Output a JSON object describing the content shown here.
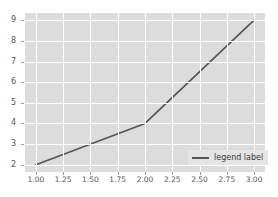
{
  "chart_data": {
    "type": "line",
    "title": "",
    "xlabel": "",
    "ylabel": "",
    "x": [
      1.0,
      2.0,
      3.0
    ],
    "series": [
      {
        "name": "legend label",
        "values": [
          2,
          4,
          9
        ],
        "color": "#555555"
      }
    ],
    "xlim": [
      0.9,
      3.1
    ],
    "ylim": [
      1.65,
      9.35
    ],
    "xticks": [
      1.0,
      1.25,
      1.5,
      1.75,
      2.0,
      2.25,
      2.5,
      2.75,
      3.0
    ],
    "xticklabels": [
      "1.00",
      "1.25",
      "1.50",
      "1.75",
      "2.00",
      "2.25",
      "2.50",
      "2.75",
      "3.00"
    ],
    "yticks": [
      2,
      3,
      4,
      5,
      6,
      7,
      8,
      9
    ],
    "yticklabels": [
      "2",
      "3",
      "4",
      "5",
      "6",
      "7",
      "8",
      "9"
    ],
    "grid": true,
    "grid_color": "#ffffff",
    "axes_facecolor": "#dcdcdc",
    "figure_facecolor": "#ffffff",
    "tick_label_color": "#555555",
    "legend": {
      "position": "lower right",
      "entries": [
        "legend label"
      ],
      "facecolor": "#e4e4e4"
    }
  }
}
